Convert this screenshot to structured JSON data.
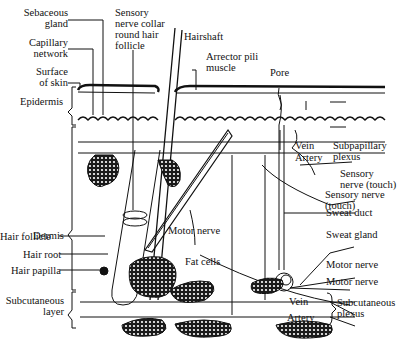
{
  "diagram": {
    "labels": {
      "sebaceous_gland": [
        "Sebaceous",
        "gland"
      ],
      "capillary_network": [
        "Capillary",
        "network"
      ],
      "surface_of_skin": [
        "Surface",
        "of skin"
      ],
      "epidermis": "Epidermis",
      "dermis": "Dermis",
      "hair_follicle": "Hair follicle",
      "hair_root": "Hair root",
      "hair_papilla": "Hair papilla",
      "subcutaneous_layer": [
        "Subcutaneous",
        "layer"
      ],
      "sensory_nerve_collar": [
        "Sensory",
        "nerve collar",
        "round hair",
        "follicle"
      ],
      "hairshaft": "Hairshaft",
      "arrector_pili": [
        "Arrector pili",
        "muscle"
      ],
      "pore": "Pore",
      "vein_upper": "Vein",
      "artery_upper": "Artery",
      "subpapillary_plexus": [
        "Subpapillary",
        "plexus"
      ],
      "sensory_nerve_touch_1": [
        "Sensory",
        "nerve (touch)"
      ],
      "sensory_nerve_touch_2": [
        "Sensory nerve",
        "(touch)"
      ],
      "sweat_duct": "Sweat duct",
      "sweat_gland": "Sweat gland",
      "motor_nerve_center": "Motor nerve",
      "fat_cells": "Fat cells",
      "motor_nerve_right_1": "Motor nerve",
      "motor_nerve_right_2": "Motor nerve",
      "vein_lower": "Vein",
      "artery_lower": "Artery",
      "subcutaneous_plexus": [
        "Subcutaneous",
        "plexus"
      ]
    },
    "colors": {
      "ink": "#111111",
      "background": "#ffffff"
    }
  }
}
